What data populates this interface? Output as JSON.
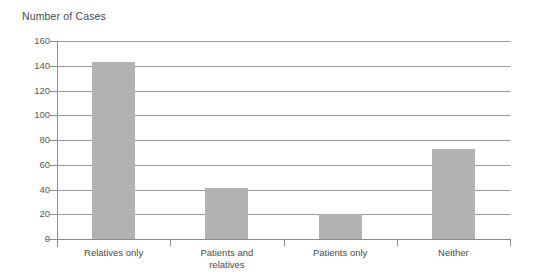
{
  "chart_data": {
    "type": "bar",
    "title": "Number of Cases",
    "xlabel": "",
    "ylabel": "",
    "categories": [
      "Relatives only",
      "Patients and\nrelatives",
      "Patients only",
      "Neither"
    ],
    "values": [
      143,
      41,
      20,
      73
    ],
    "ylim": [
      0,
      160
    ],
    "ytick_step": 20,
    "yticks": [
      0,
      20,
      40,
      60,
      80,
      100,
      120,
      140,
      160
    ],
    "ytick_labels": [
      "0",
      "20",
      "40",
      "60",
      "80",
      "100",
      "120",
      "140",
      "160"
    ],
    "grid": true,
    "grid_axis": "y",
    "legend": null,
    "bar_color": "#b2b2b2",
    "axis_color": "#8c8c8c",
    "grid_color": "#9a9a9a",
    "background": "#ffffff"
  }
}
